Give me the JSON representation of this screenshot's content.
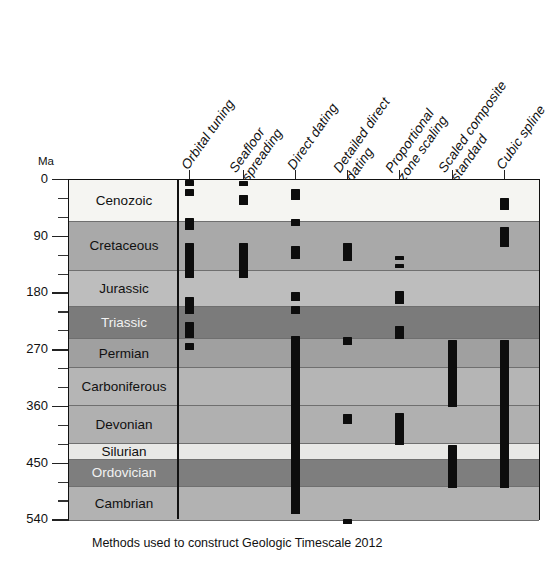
{
  "figure": {
    "caption": "Methods used to construct Geologic Timescale 2012",
    "y_axis_unit": "Ma"
  },
  "chart_data": {
    "type": "heatmap",
    "title": "Methods used to construct Geologic Timescale 2012",
    "xlabel": "",
    "ylabel": "Ma",
    "ylim": [
      0,
      540
    ],
    "y_inverted": true,
    "grid": true,
    "legend": "none",
    "y_ticks_major": [
      0,
      90,
      180,
      270,
      360,
      450,
      540
    ],
    "y_ticks_minor": [
      30,
      60,
      120,
      150,
      210,
      240,
      300,
      330,
      390,
      420,
      480,
      510
    ],
    "categories": [
      "Orbital tuning",
      "Seafloor spreading",
      "Direct dating",
      "Detailed direct dating",
      "Proportional zone scaling",
      "Scaled composite standard",
      "Cubic spline"
    ],
    "category_lines": [
      [
        "Orbital tuning",
        ""
      ],
      [
        "Seafloor",
        "spreading"
      ],
      [
        "Direct dating",
        ""
      ],
      [
        "Detailed direct",
        "dating"
      ],
      [
        "Proportional",
        "zone scaling"
      ],
      [
        "Scaled composite",
        "standard"
      ],
      [
        "Cubic spline",
        ""
      ]
    ],
    "periods": [
      {
        "name": "Cenozoic",
        "start": 0,
        "end": 66,
        "shade": "#f5f5f2",
        "text": "dark"
      },
      {
        "name": "Cretaceous",
        "start": 66,
        "end": 145,
        "shade": "#a9a9a9",
        "text": "dark"
      },
      {
        "name": "Jurassic",
        "start": 145,
        "end": 201,
        "shade": "#bdbdbd",
        "text": "dark"
      },
      {
        "name": "Triassic",
        "start": 201,
        "end": 252,
        "shade": "#7b7b7b",
        "text": "light"
      },
      {
        "name": "Permian",
        "start": 252,
        "end": 299,
        "shade": "#a0a0a0",
        "text": "dark"
      },
      {
        "name": "Carboniferous",
        "start": 299,
        "end": 359,
        "shade": "#b5b5b5",
        "text": "dark"
      },
      {
        "name": "Devonian",
        "start": 359,
        "end": 419,
        "shade": "#b0b0b0",
        "text": "dark"
      },
      {
        "name": "Silurian",
        "start": 419,
        "end": 444,
        "shade": "#e8e8e6",
        "text": "dark"
      },
      {
        "name": "Ordovician",
        "start": 444,
        "end": 487,
        "shade": "#7e7e7e",
        "text": "light"
      },
      {
        "name": "Cambrian",
        "start": 487,
        "end": 541,
        "shade": "#b2b2b2",
        "text": "dark"
      }
    ],
    "series": [
      {
        "name": "Orbital tuning",
        "intervals": [
          [
            0,
            9
          ],
          [
            14,
            25
          ],
          [
            60,
            80
          ],
          [
            100,
            155
          ],
          [
            185,
            212
          ],
          [
            225,
            250
          ],
          [
            258,
            270
          ]
        ]
      },
      {
        "name": "Seafloor spreading",
        "intervals": [
          [
            2,
            10
          ],
          [
            24,
            40
          ],
          [
            100,
            155
          ]
        ]
      },
      {
        "name": "Direct dating",
        "intervals": [
          [
            14,
            32
          ],
          [
            62,
            73
          ],
          [
            104,
            126
          ],
          [
            178,
            192
          ],
          [
            200,
            213
          ],
          [
            248,
            530
          ]
        ]
      },
      {
        "name": "Detailed direct dating",
        "intervals": [
          [
            100,
            128
          ],
          [
            249,
            262
          ],
          [
            372,
            387
          ],
          [
            538,
            546
          ]
        ]
      },
      {
        "name": "Proportional zone scaling",
        "intervals": [
          [
            120,
            127
          ],
          [
            133,
            140
          ],
          [
            176,
            196
          ],
          [
            232,
            252
          ],
          [
            370,
            421
          ]
        ]
      },
      {
        "name": "Scaled composite standard",
        "intervals": [
          [
            254,
            360
          ],
          [
            420,
            489
          ]
        ]
      },
      {
        "name": "Cubic spline",
        "intervals": [
          [
            28,
            48
          ],
          [
            74,
            106
          ],
          [
            254,
            489
          ]
        ]
      }
    ]
  }
}
